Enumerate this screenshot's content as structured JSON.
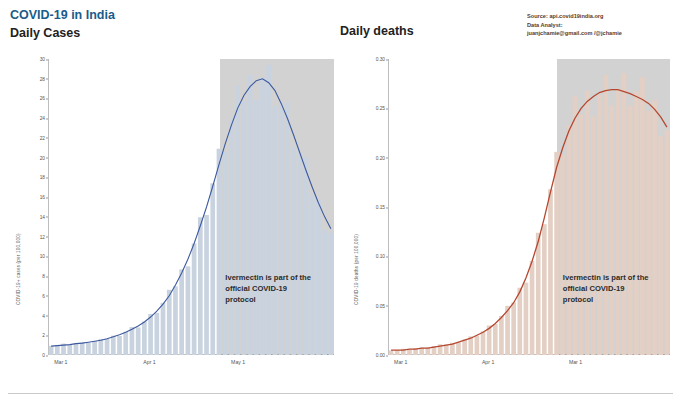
{
  "header": {
    "title_main": "COVID-19 in India",
    "title_sub": "Daily Cases",
    "right_title": "Daily deaths",
    "source_lines": [
      "Source: api.covid19india.org",
      "Data Analyst:",
      "juanjchamie@gmail.com /@jchamie"
    ]
  },
  "annotation": {
    "line1": "Ivermectin is part of the",
    "line2": "official COVID-19",
    "line3": "protocol"
  },
  "chart_data": [
    {
      "type": "bar",
      "id": "daily-cases",
      "title": "Daily Cases",
      "xlabel": "",
      "ylabel": "COVID-19+ cases (per 100,000)",
      "ylim": [
        0,
        30
      ],
      "yticks": [
        0,
        2,
        4,
        6,
        8,
        10,
        12,
        14,
        16,
        18,
        20,
        22,
        24,
        26,
        28,
        30
      ],
      "xticks": [
        "Mar 1",
        "Apr 1",
        "May 1"
      ],
      "grid": false,
      "legend": "none",
      "accent": "#3d5a9e",
      "bar_color": "#c9d3e0",
      "shade_start": "May 1",
      "x": [
        "Mar 1",
        "Mar 3",
        "Mar 5",
        "Mar 7",
        "Mar 9",
        "Mar 11",
        "Mar 13",
        "Mar 15",
        "Mar 17",
        "Mar 19",
        "Mar 21",
        "Mar 23",
        "Mar 25",
        "Mar 27",
        "Mar 29",
        "Mar 31",
        "Apr 2",
        "Apr 4",
        "Apr 6",
        "Apr 8",
        "Apr 10",
        "Apr 12",
        "Apr 14",
        "Apr 16",
        "Apr 18",
        "Apr 20",
        "Apr 22",
        "Apr 24",
        "Apr 26",
        "Apr 28",
        "Apr 30",
        "May 2",
        "May 4",
        "May 6",
        "May 8",
        "May 10",
        "May 12",
        "May 14",
        "May 16",
        "May 18",
        "May 20",
        "May 22",
        "May 24",
        "May 26",
        "May 28",
        "May 30"
      ],
      "values": [
        1.0,
        1.0,
        1.1,
        1.1,
        1.2,
        1.2,
        1.3,
        1.4,
        1.5,
        1.7,
        1.9,
        2.1,
        2.4,
        2.7,
        3.0,
        3.4,
        3.9,
        4.5,
        5.2,
        6.1,
        7.2,
        8.4,
        9.8,
        11.5,
        13.3,
        15.2,
        17.4,
        19.6,
        21.7,
        23.6,
        25.2,
        26.6,
        27.5,
        28.2,
        28.6,
        28.0,
        27.0,
        25.6,
        24.0,
        22.2,
        20.3,
        18.5,
        16.8,
        15.2,
        13.8,
        12.6
      ],
      "trend": {
        "name": "7-day average",
        "color": "#3d5a9e",
        "values": [
          0.9,
          0.95,
          1.0,
          1.05,
          1.15,
          1.2,
          1.3,
          1.4,
          1.5,
          1.65,
          1.85,
          2.05,
          2.3,
          2.6,
          2.95,
          3.35,
          3.85,
          4.45,
          5.15,
          6.0,
          7.1,
          8.3,
          9.7,
          11.3,
          13.1,
          15.0,
          17.1,
          19.3,
          21.4,
          23.3,
          25.0,
          26.3,
          27.2,
          27.8,
          28.0,
          27.6,
          26.8,
          25.5,
          24.0,
          22.3,
          20.5,
          18.7,
          17.0,
          15.4,
          14.0,
          12.8
        ]
      }
    },
    {
      "type": "bar",
      "id": "daily-deaths",
      "title": "Daily deaths",
      "xlabel": "",
      "ylabel": "COVID-19 deaths (per 100,000)",
      "ylim": [
        0,
        0.3
      ],
      "yticks": [
        0.0,
        0.05,
        0.1,
        0.15,
        0.2,
        0.25,
        0.3
      ],
      "xticks": [
        "Mar 1",
        "Apr 1",
        "Mar 1"
      ],
      "grid": false,
      "legend": "none",
      "accent": "#b5472f",
      "bar_color": "#e3cfc4",
      "shade_start": "Mar 1",
      "x": [
        "Mar 1",
        "Mar 3",
        "Mar 5",
        "Mar 7",
        "Mar 9",
        "Mar 11",
        "Mar 13",
        "Mar 15",
        "Mar 17",
        "Mar 19",
        "Mar 21",
        "Mar 23",
        "Mar 25",
        "Mar 27",
        "Mar 29",
        "Mar 31",
        "Apr 2",
        "Apr 4",
        "Apr 6",
        "Apr 8",
        "Apr 10",
        "Apr 12",
        "Apr 14",
        "Apr 16",
        "Apr 18",
        "Apr 20",
        "Apr 22",
        "Apr 24",
        "Apr 26",
        "Apr 28",
        "Apr 30",
        "May 2",
        "May 4",
        "May 6",
        "May 8",
        "May 10",
        "May 12",
        "May 14",
        "May 16",
        "May 18",
        "May 20",
        "May 22",
        "May 24",
        "May 26",
        "May 28",
        "May 30"
      ],
      "values": [
        0.005,
        0.005,
        0.006,
        0.006,
        0.007,
        0.007,
        0.008,
        0.009,
        0.01,
        0.011,
        0.012,
        0.014,
        0.016,
        0.018,
        0.021,
        0.024,
        0.028,
        0.033,
        0.039,
        0.046,
        0.055,
        0.066,
        0.08,
        0.097,
        0.118,
        0.142,
        0.168,
        0.193,
        0.213,
        0.229,
        0.242,
        0.252,
        0.259,
        0.264,
        0.268,
        0.27,
        0.271,
        0.27,
        0.268,
        0.266,
        0.263,
        0.26,
        0.256,
        0.25,
        0.242,
        0.232
      ],
      "trend": {
        "name": "7-day average",
        "color": "#b5472f",
        "values": [
          0.005,
          0.005,
          0.005,
          0.006,
          0.006,
          0.007,
          0.007,
          0.008,
          0.009,
          0.01,
          0.011,
          0.013,
          0.015,
          0.017,
          0.02,
          0.023,
          0.027,
          0.032,
          0.038,
          0.045,
          0.053,
          0.064,
          0.078,
          0.095,
          0.115,
          0.139,
          0.165,
          0.19,
          0.21,
          0.227,
          0.24,
          0.25,
          0.257,
          0.262,
          0.266,
          0.268,
          0.269,
          0.269,
          0.267,
          0.265,
          0.262,
          0.259,
          0.255,
          0.249,
          0.241,
          0.231
        ]
      }
    }
  ]
}
